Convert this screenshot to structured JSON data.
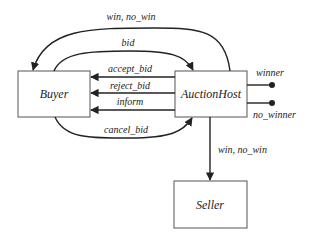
{
  "nodes": {
    "buyer": {
      "label": "Buyer"
    },
    "auction_host": {
      "label": "AuctionHost"
    },
    "seller": {
      "label": "Seller"
    }
  },
  "edges": {
    "host_to_buyer_outcome": {
      "label": "win, no_win"
    },
    "buyer_to_host_bid": {
      "label": "bid"
    },
    "host_to_buyer_accept": {
      "label": "accept_bid"
    },
    "host_to_buyer_reject": {
      "label": "reject_bid"
    },
    "host_to_buyer_inform": {
      "label": "inform"
    },
    "buyer_to_host_cancel": {
      "label": "cancel_bid"
    },
    "host_to_seller_outcome": {
      "label": "win, no_win"
    }
  },
  "terminals": {
    "winner": {
      "label": "winner"
    },
    "no_winner": {
      "label": "no_winner"
    }
  }
}
